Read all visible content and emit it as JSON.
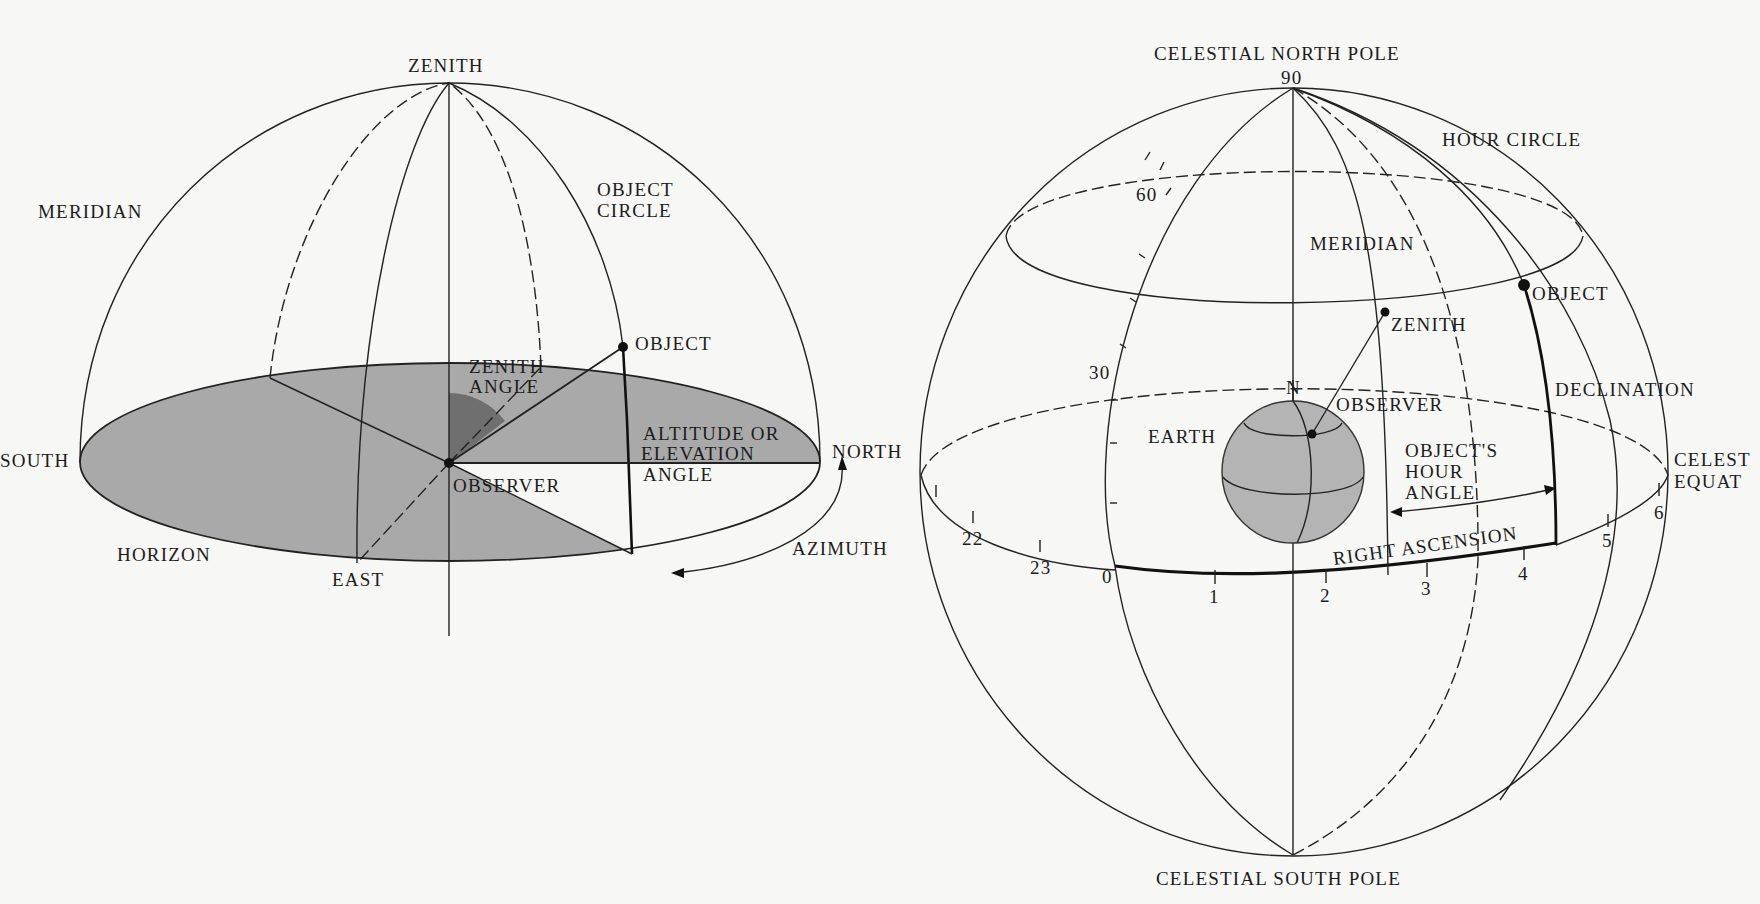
{
  "figures": {
    "horizon_system": {
      "labels": {
        "zenith": "ZENITH",
        "meridian": "MERIDIAN",
        "object_circle_1": "OBJECT",
        "object_circle_2": "CIRCLE",
        "object": "OBJECT",
        "zenith_angle_1": "ZENITH",
        "zenith_angle_2": "ANGLE",
        "south": "SOUTH",
        "altitude_1": "ALTITUDE OR",
        "altitude_2": "ELEVATION",
        "altitude_3": "ANGLE",
        "north": "NORTH",
        "observer": "OBSERVER",
        "horizon": "HORIZON",
        "east": "EAST",
        "azimuth": "AZIMUTH"
      },
      "colors": {
        "horizon_fill": "#a9a9a9",
        "zenith_angle_fill": "#6f6f6f"
      }
    },
    "equatorial_system": {
      "labels": {
        "north_pole": "CELESTIAL NORTH POLE",
        "south_pole": "CELESTIAL SOUTH POLE",
        "hour_circle": "HOUR CIRCLE",
        "meridian": "MERIDIAN",
        "object": "OBJECT",
        "zenith": "ZENITH",
        "declination": "DECLINATION",
        "n": "N",
        "observer": "OBSERVER",
        "earth": "EARTH",
        "hour_angle_1": "OBJECT'S",
        "hour_angle_2": "HOUR",
        "hour_angle_3": "ANGLE",
        "right_ascension": "RIGHT ASCENSION",
        "celestial_equator_1": "CELEST",
        "celestial_equator_2": "EQUAT"
      },
      "declination_ticks": [
        "90",
        "60",
        "30"
      ],
      "ra_ticks": [
        "22",
        "23",
        "0",
        "1",
        "2",
        "3",
        "4",
        "5",
        "6"
      ],
      "colors": {
        "earth_fill": "#b4b4b4"
      }
    }
  }
}
